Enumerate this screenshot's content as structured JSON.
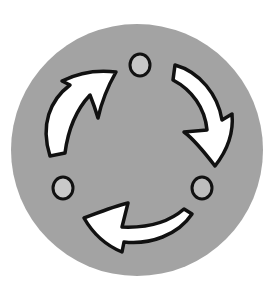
{
  "image": {
    "title": "Cycle icon",
    "description": "Gray circular badge with three white curved arrows forming a clockwise cycle, separated by three light-gray dots"
  },
  "colors": {
    "background": "#ffffff",
    "disc": "#a3a3a3",
    "arrow_fill": "#ffffff",
    "outline": "#111111",
    "dot_fill": "#c6c6c6"
  },
  "elements": {
    "arrows": [
      {
        "name": "top-left-arrow",
        "direction": "up-right"
      },
      {
        "name": "right-arrow",
        "direction": "down"
      },
      {
        "name": "bottom-arrow",
        "direction": "left"
      }
    ],
    "dots": [
      {
        "name": "top-dot"
      },
      {
        "name": "bottom-left-dot"
      },
      {
        "name": "bottom-right-dot"
      }
    ]
  }
}
